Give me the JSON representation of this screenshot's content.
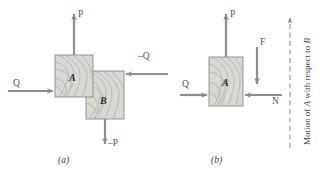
{
  "figure": {
    "caption_a": "(a)",
    "caption_b": "(b)",
    "panel_a": {
      "block_a_label": "A",
      "block_b_label": "B",
      "force_up_label": "P",
      "force_down_label": "–P",
      "force_left_label": "Q",
      "force_right_label": "–Q"
    },
    "panel_b": {
      "block_a_label": "A",
      "force_up_label": "P",
      "force_left_label": "Q",
      "friction_label": "F",
      "normal_label": "N",
      "motion_text_prefix": "Motion of ",
      "motion_text_a": "A",
      "motion_text_mid": " with respect to ",
      "motion_text_b": "B"
    },
    "colors": {
      "block_fill": "#d8d8d4",
      "block_stroke": "#8a8a86",
      "grain_stroke": "#b4b4ae",
      "arrow": "#8e8e8e",
      "dashed_axis": "#8e8e8e",
      "text": "#4a4a4a",
      "background": "#ffffff"
    }
  }
}
